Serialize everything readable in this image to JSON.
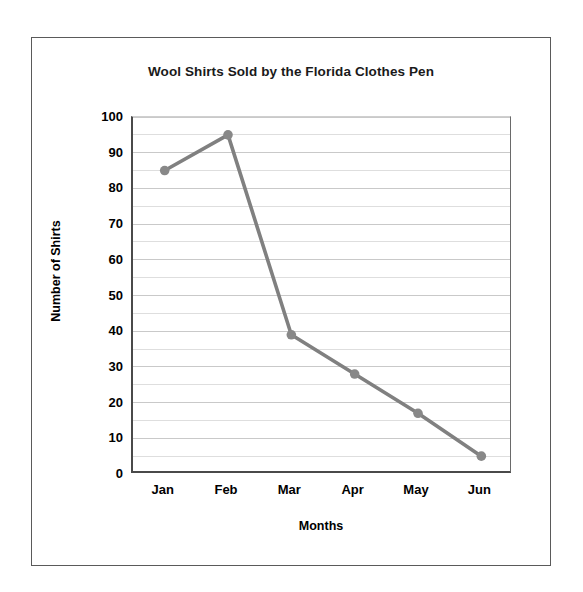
{
  "chart_data": {
    "type": "line",
    "title": "Wool Shirts Sold by the Florida Clothes Pen",
    "xlabel": "Months",
    "ylabel": "Number of Shirts",
    "categories": [
      "Jan",
      "Feb",
      "Mar",
      "Apr",
      "May",
      "Jun"
    ],
    "values": [
      85,
      95,
      39,
      28,
      17,
      5
    ],
    "series": [
      {
        "name": "Wool Shirts Sold",
        "values": [
          85,
          95,
          39,
          28,
          17,
          5
        ]
      }
    ],
    "ylim": [
      0,
      100
    ],
    "ytick_labels": [
      "0",
      "10",
      "20",
      "30",
      "40",
      "50",
      "60",
      "70",
      "80",
      "90",
      "100"
    ],
    "ytick_values": [
      0,
      10,
      20,
      30,
      40,
      50,
      60,
      70,
      80,
      90,
      100
    ],
    "y_minor_step": 5,
    "grid": true,
    "grid_axis": "y",
    "legend": "none",
    "marker": "circle",
    "colors": {
      "line": "#808080",
      "marker": "#888888",
      "gridline_major": "#c9c9c9",
      "gridline_minor": "#dedede",
      "axis": "#4a4a4a",
      "frame": "#5a5a5a",
      "text": "#000000"
    }
  }
}
